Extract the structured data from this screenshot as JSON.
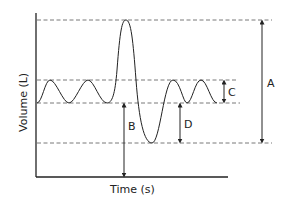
{
  "diagram": {
    "type": "spirogram",
    "x_axis_label": "Time (s)",
    "y_axis_label": "Volume (L)",
    "labels": {
      "A": "A",
      "B": "B",
      "C": "C",
      "D": "D"
    },
    "colors": {
      "line": "#222222",
      "dashed": "#555555",
      "background": "#ffffff"
    }
  }
}
